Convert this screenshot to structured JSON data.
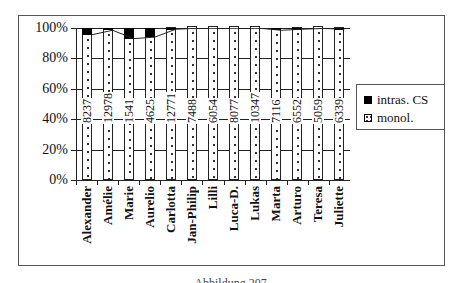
{
  "chart_data": {
    "type": "bar",
    "stacked": true,
    "percent": true,
    "title": "",
    "xlabel": "",
    "ylabel": "",
    "ylim": [
      0,
      100
    ],
    "yticks": [
      "0%",
      "20%",
      "40%",
      "60%",
      "80%",
      "100%"
    ],
    "categories": [
      "Alexander",
      "Amélie",
      "Marie",
      "Aurelio",
      "Carlotta",
      "Jan-Philip",
      "Lilli",
      "Luca-D.",
      "Lukas",
      "Marta",
      "Arturo",
      "Teresa",
      "Juliette"
    ],
    "bar_labels": [
      "8237",
      "12978",
      "1541",
      "4625",
      "12771",
      "7488",
      "6054",
      "8077",
      "10347",
      "7116",
      "6552",
      "5059",
      "6339"
    ],
    "series": [
      {
        "name": "intras. CS",
        "color": "#000000",
        "values": [
          4.5,
          1.5,
          7,
          6,
          0.8,
          0.2,
          0.2,
          0.2,
          0.2,
          1.5,
          0.8,
          0.3,
          0.8
        ]
      },
      {
        "name": "monol.",
        "color": "#ffffff",
        "pattern": "dotted",
        "values": [
          95.5,
          98.5,
          93,
          94,
          99.2,
          99.8,
          99.8,
          99.8,
          99.8,
          98.5,
          99.2,
          99.7,
          99.2
        ]
      }
    ],
    "grid": true,
    "legend_position": "right"
  },
  "legend": {
    "cs_label": "intras. CS",
    "mono_label": "monol."
  },
  "caption": "Abbildung 207"
}
